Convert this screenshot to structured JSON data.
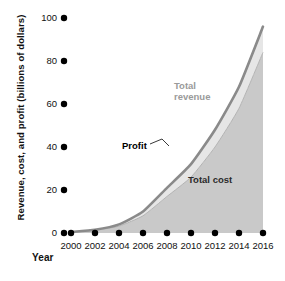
{
  "axes": {
    "ylabel": "Revenue, cost, and profit (billions of dollars)",
    "xlabel": "Year",
    "yticks": [
      "100",
      "80",
      "60",
      "40",
      "20",
      "0"
    ],
    "xticks": [
      "2000",
      "2002",
      "2004",
      "2006",
      "2008",
      "2010",
      "2012",
      "2014",
      "2016"
    ]
  },
  "labels": {
    "total_revenue": "Total\nrevenue",
    "profit": "Profit",
    "total_cost": "Total cost"
  },
  "colors": {
    "revenue_line": "#8a8a8a",
    "profit_fill": "#e6e6e6",
    "cost_fill": "#c9c9c9",
    "tick_dot": "#000000",
    "text": "#111111",
    "revenue_label": "#9a9a9a"
  },
  "chart_data": {
    "type": "area",
    "title": "",
    "xlabel": "Year",
    "ylabel": "Revenue, cost, and profit (billions of dollars)",
    "x": [
      2000,
      2002,
      2004,
      2006,
      2008,
      2010,
      2012,
      2014,
      2016
    ],
    "xlim": [
      2000,
      2016
    ],
    "ylim": [
      0,
      100
    ],
    "ytick_values": [
      0,
      20,
      40,
      60,
      80,
      100
    ],
    "grid": false,
    "legend": "inline-annotations",
    "series": [
      {
        "name": "Total revenue",
        "role": "upper-boundary-line",
        "values": [
          0.5,
          1.5,
          4,
          10,
          21,
          32,
          48,
          68,
          96
        ]
      },
      {
        "name": "Total cost",
        "role": "filled-area",
        "values": [
          0.4,
          1.2,
          3.2,
          8,
          17,
          26,
          40,
          58,
          84
        ]
      },
      {
        "name": "Profit",
        "role": "band-between-revenue-and-cost",
        "values": [
          0.1,
          0.3,
          0.8,
          2,
          4,
          6,
          8,
          10,
          12
        ]
      }
    ],
    "annotations": [
      {
        "text": "Total revenue",
        "x": 2010,
        "y": 62
      },
      {
        "text": "Profit",
        "x": 2007,
        "y": 42,
        "leader_line": true
      },
      {
        "text": "Total cost",
        "x": 2011.5,
        "y": 27
      }
    ]
  }
}
